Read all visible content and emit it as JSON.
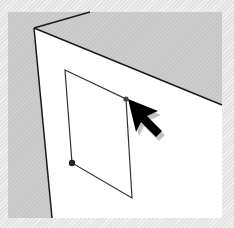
{
  "scene": {
    "description": "3D modeling viewport: drawing a rectangle on the front face of a box",
    "colors": {
      "frame_bg": "#e4e4e4",
      "shaded_face": "#c8c8c8",
      "front_face": "#ffffff",
      "edge": "#1a1a1a",
      "rectangle_edge": "#333333",
      "cursor": "#000000",
      "cursor_shadow": "#9a9a9a"
    },
    "tool": "rectangle-tool",
    "cursor": {
      "icon": "arrow-cursor-icon",
      "tip_x": 128,
      "tip_y": 99
    },
    "rectangle_points": [
      {
        "x": 65,
        "y": 70
      },
      {
        "x": 126,
        "y": 99
      },
      {
        "x": 132,
        "y": 198
      },
      {
        "x": 72,
        "y": 163
      }
    ],
    "vertex_markers": [
      {
        "x": 126,
        "y": 99
      },
      {
        "x": 72,
        "y": 163
      }
    ]
  }
}
